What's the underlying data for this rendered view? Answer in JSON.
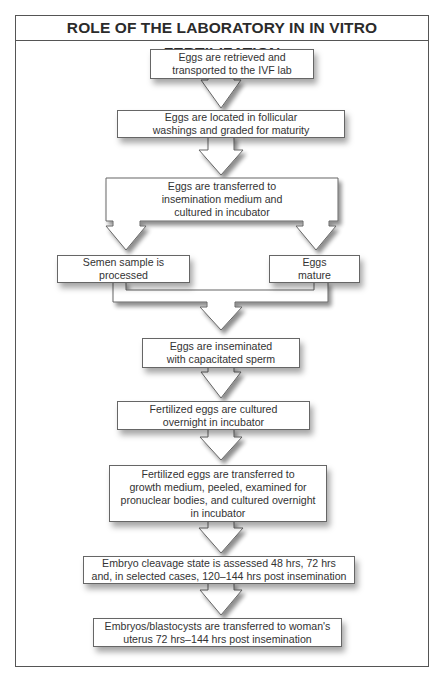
{
  "title": "ROLE OF THE LABORATORY IN IN VITRO FERTILIZATION",
  "steps": {
    "retrieved": [
      "Eggs are retrieved and",
      "transported to the IVF lab"
    ],
    "located": [
      "Eggs are located in follicular",
      "washings and graded for maturity"
    ],
    "transferred_insemination": [
      "Eggs are transferred to",
      "insemination medium and",
      "cultured in incubator"
    ],
    "semen": [
      "Semen sample is",
      "processed"
    ],
    "eggs_mature": [
      "Eggs",
      "mature"
    ],
    "inseminated": [
      "Eggs are inseminated",
      "with capacitated sperm"
    ],
    "fertilized_cultured": [
      "Fertilized eggs are cultured",
      "overnight in incubator"
    ],
    "fertilized_transferred": [
      "Fertilized eggs are transferred to",
      "growth medium, peeled, examined for",
      "pronuclear bodies, and cultured overnight",
      "in incubator"
    ],
    "cleavage": [
      "Embryo cleavage state is assessed 48 hrs, 72 hrs",
      "and, in selected cases, 120–144 hrs post insemination"
    ],
    "embryo_transfer": [
      "Embryos/blastocysts are transferred to woman's",
      "uterus 72 hrs–144 hrs post insemination"
    ]
  },
  "colors": {
    "border": "#555555",
    "box_border": "#666666",
    "text": "#333333",
    "shadow": "rgba(0,0,0,0.35)"
  }
}
